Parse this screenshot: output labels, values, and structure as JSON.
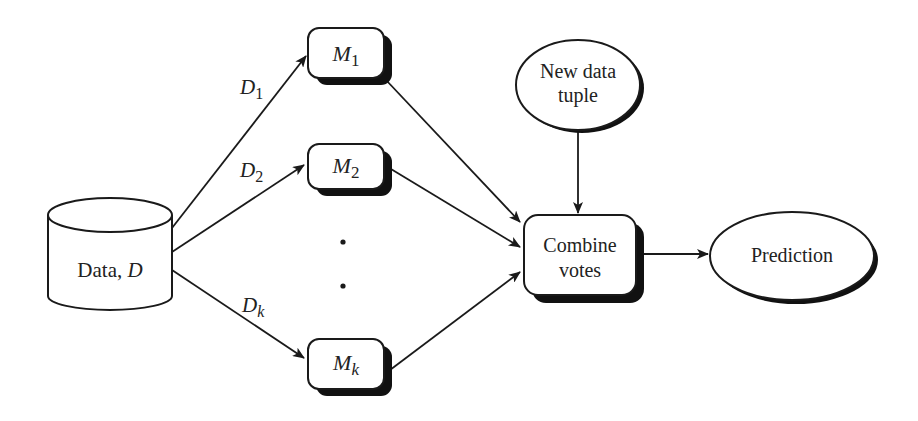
{
  "diagram": {
    "type": "flowchart",
    "title": "",
    "nodes": {
      "data": {
        "label": "Data, ",
        "label_italic": "D",
        "shape": "cylinder"
      },
      "m1": {
        "base": "M",
        "sub": "1",
        "shape": "rounded-rect"
      },
      "m2": {
        "base": "M",
        "sub": "2",
        "shape": "rounded-rect"
      },
      "mk": {
        "base": "M",
        "sub": "k",
        "shape": "rounded-rect"
      },
      "ellipsis": {
        "symbol": "• •",
        "meaning": "more models"
      },
      "new_tuple": {
        "line1": "New data",
        "line2": "tuple",
        "shape": "ellipse"
      },
      "combine": {
        "line1": "Combine",
        "line2": "votes",
        "shape": "rounded-rect"
      },
      "prediction": {
        "label": "Prediction",
        "shape": "ellipse"
      }
    },
    "edges": [
      {
        "from": "data",
        "to": "m1",
        "base": "D",
        "sub": "1"
      },
      {
        "from": "data",
        "to": "m2",
        "base": "D",
        "sub": "2"
      },
      {
        "from": "data",
        "to": "mk",
        "base": "D",
        "sub": "k"
      },
      {
        "from": "m1",
        "to": "combine"
      },
      {
        "from": "m2",
        "to": "combine"
      },
      {
        "from": "mk",
        "to": "combine"
      },
      {
        "from": "new_tuple",
        "to": "combine"
      },
      {
        "from": "combine",
        "to": "prediction"
      }
    ],
    "colors": {
      "stroke": "#1a1a1a",
      "fill": "#ffffff",
      "shadow": "#111111",
      "text": "#222222"
    }
  }
}
